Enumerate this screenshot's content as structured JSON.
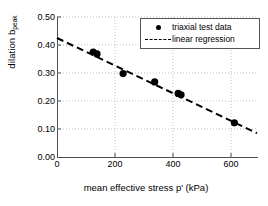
{
  "chart_data": {
    "type": "scatter",
    "title": "",
    "xlabel": "mean effective stress p' (kPa)",
    "ylabel": "dilation b",
    "ylabel_subscript": "peak",
    "xlim": [
      0,
      690
    ],
    "ylim": [
      0.0,
      0.5
    ],
    "xticks": [
      0,
      200,
      400,
      600
    ],
    "xtick_labels": [
      "0",
      "200",
      "400",
      "600"
    ],
    "yticks": [
      0.0,
      0.1,
      0.2,
      0.3,
      0.4,
      0.5
    ],
    "ytick_labels": [
      "0.00",
      "0.10",
      "0.20",
      "0.30",
      "0.40",
      "0.50"
    ],
    "grid": true,
    "grid_style": "dotted",
    "legend_position": "top-right",
    "series": [
      {
        "name": "triaxial test data",
        "type": "scatter",
        "marker": "filled-circle",
        "color": "#000000",
        "points": [
          {
            "x": 125,
            "y": 0.375
          },
          {
            "x": 138,
            "y": 0.368
          },
          {
            "x": 228,
            "y": 0.298
          },
          {
            "x": 337,
            "y": 0.268
          },
          {
            "x": 418,
            "y": 0.227
          },
          {
            "x": 428,
            "y": 0.222
          },
          {
            "x": 612,
            "y": 0.122
          }
        ]
      },
      {
        "name": "linear regression",
        "type": "line",
        "style": "dashed",
        "color": "#000000",
        "endpoints": [
          {
            "x": 0,
            "y": 0.425
          },
          {
            "x": 690,
            "y": 0.085
          }
        ],
        "slope": -0.00049,
        "intercept": 0.425
      }
    ]
  },
  "legend": {
    "items": [
      {
        "label": "triaxial test data",
        "key": "marker-dot-icon"
      },
      {
        "label": "linear regression",
        "key": "dashed-line-icon"
      }
    ]
  },
  "colors": {
    "axis": "#4d4d4d",
    "grid": "#b8b8b8",
    "data": "#000000"
  }
}
